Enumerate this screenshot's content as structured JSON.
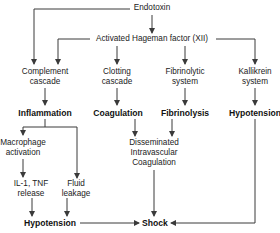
{
  "diagram": {
    "line_color": "#3a3a3a",
    "nodes": {
      "endotoxin": "Endotoxin",
      "hageman": "Activated Hageman factor (XII)",
      "complement_1": "Complement",
      "complement_2": "cascade",
      "clotting_1": "Clotting",
      "clotting_2": "cascade",
      "fibrinolytic_1": "Fibrinolytic",
      "fibrinolytic_2": "system",
      "kallikrein_1": "Kallikrein",
      "kallikrein_2": "system",
      "inflammation": "Inflammation",
      "coagulation": "Coagulation",
      "fibrinolysis": "Fibrinolysis",
      "hypotension_right": "Hypotension",
      "macrophage_1": "Macrophage",
      "macrophage_2": "activation",
      "dic_1": "Disseminated",
      "dic_2": "Intravascular",
      "dic_3": "Coagulation",
      "il1_1": "IL-1, TNF",
      "il1_2": "release",
      "fluid_1": "Fluid",
      "fluid_2": "leakage",
      "hypotension_bottom": "Hypotension",
      "shock": "Shock"
    },
    "edges": [
      [
        "Endotoxin",
        "Activated Hageman factor (XII)"
      ],
      [
        "Endotoxin",
        "Complement cascade"
      ],
      [
        "Activated Hageman factor (XII)",
        "Complement cascade"
      ],
      [
        "Activated Hageman factor (XII)",
        "Clotting cascade"
      ],
      [
        "Activated Hageman factor (XII)",
        "Fibrinolytic system"
      ],
      [
        "Activated Hageman factor (XII)",
        "Kallikrein system"
      ],
      [
        "Complement cascade",
        "Inflammation"
      ],
      [
        "Clotting cascade",
        "Coagulation"
      ],
      [
        "Fibrinolytic system",
        "Fibrinolysis"
      ],
      [
        "Kallikrein system",
        "Hypotension"
      ],
      [
        "Inflammation",
        "Macrophage activation"
      ],
      [
        "Inflammation",
        "Fluid leakage"
      ],
      [
        "Coagulation",
        "Disseminated Intravascular Coagulation"
      ],
      [
        "Fibrinolysis",
        "Disseminated Intravascular Coagulation"
      ],
      [
        "Macrophage activation",
        "IL-1, TNF release"
      ],
      [
        "IL-1, TNF release",
        "Hypotension"
      ],
      [
        "Fluid leakage",
        "Hypotension"
      ],
      [
        "Hypotension",
        "Shock"
      ],
      [
        "Disseminated Intravascular Coagulation",
        "Shock"
      ],
      [
        "Hypotension (kallikrein)",
        "Shock"
      ]
    ]
  }
}
